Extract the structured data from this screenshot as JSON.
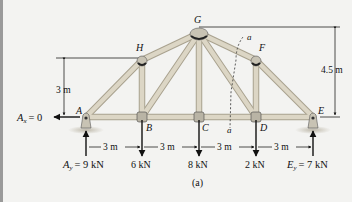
{
  "figure": {
    "caption": "(a)",
    "joints": {
      "A": {
        "label": "A",
        "x": 86,
        "y": 117
      },
      "B": {
        "label": "B",
        "x": 142,
        "y": 117
      },
      "C": {
        "label": "C",
        "x": 199,
        "y": 117
      },
      "D": {
        "label": "D",
        "x": 256,
        "y": 117
      },
      "E": {
        "label": "E",
        "x": 313,
        "y": 117
      },
      "H": {
        "label": "H",
        "x": 142,
        "y": 60
      },
      "G": {
        "label": "G",
        "x": 199,
        "y": 33
      },
      "F": {
        "label": "F",
        "x": 256,
        "y": 60
      }
    },
    "members": [
      "AB",
      "BC",
      "CD",
      "DE",
      "AH",
      "HG",
      "GF",
      "FE",
      "BH",
      "CG",
      "DF",
      "BG",
      "DG"
    ],
    "dimensions": {
      "left_height": "3 m",
      "right_height": "4.5 m",
      "spans": [
        "3 m",
        "3 m",
        "3 m",
        "3 m"
      ]
    },
    "loads": {
      "B": "6 kN",
      "C": "8 kN",
      "D": "2 kN"
    },
    "reactions": {
      "Ax": {
        "symbol": "A",
        "sub": "x",
        "value": "= 0"
      },
      "Ay": {
        "symbol": "A",
        "sub": "y",
        "value": "= 9 kN"
      },
      "Ey": {
        "symbol": "E",
        "sub": "y",
        "value": "= 7 kN"
      }
    },
    "section": {
      "top_label": "a",
      "bottom_label": "a"
    },
    "colors": {
      "member": "#d9d3c1",
      "member_edge": "#a9a28f",
      "joint": "#c9c4b6",
      "ink": "#111111",
      "background": "#f3f3f1"
    }
  }
}
